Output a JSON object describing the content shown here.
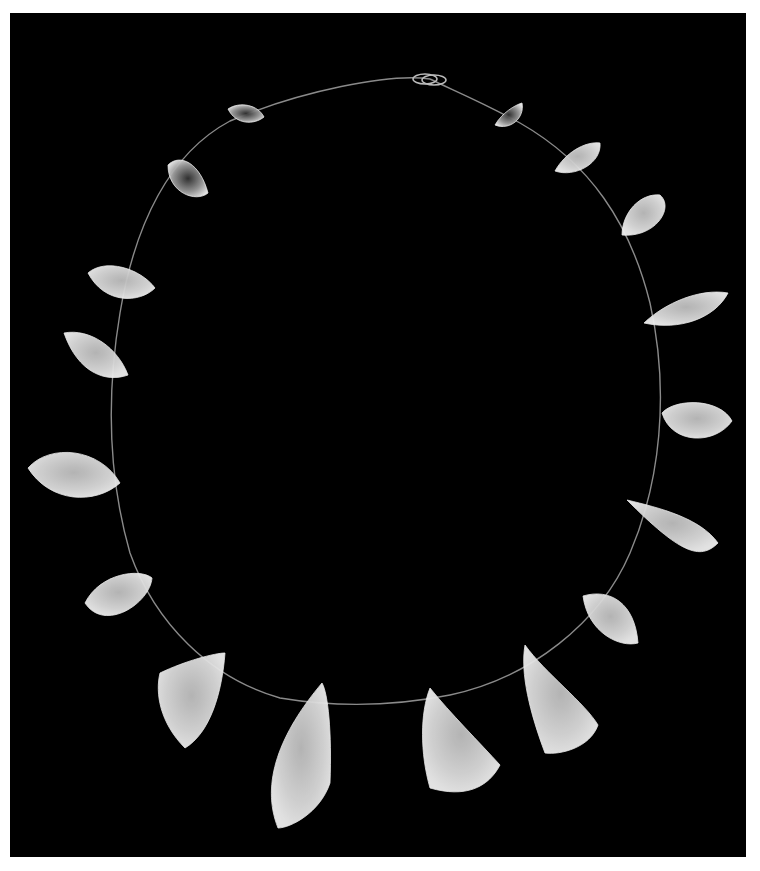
{
  "photo": {
    "subject": "rock crystal bead necklace on black background",
    "background_color": "#000000",
    "frame_color": "#ffffff",
    "bead_color": "#d8d8d8"
  },
  "necklace": {
    "cord_path": "M 420 66 C 380 60, 290 78, 220 108 C 160 140, 125 210, 110 300 C 95 390, 100 470, 120 540 C 145 610, 200 665, 270 685 C 330 695, 390 692, 440 682 C 520 665, 590 610, 620 540 C 650 470, 660 380, 640 290 C 620 210, 580 150, 510 110 C 470 88, 440 76, 420 66",
    "clasp_left": {
      "cx": 423,
      "cy": 64
    },
    "clasp_right": {
      "cx": 412,
      "cy": 75
    },
    "beads": [
      {
        "id": 1,
        "shape": "M 218 96 C 230 88, 248 92, 254 104 C 244 112, 226 112, 218 96 Z",
        "clear": true
      },
      {
        "id": 2,
        "shape": "M 158 152 C 170 140, 190 150, 198 180 C 186 190, 158 180, 158 152 Z",
        "clear": true
      },
      {
        "id": 3,
        "shape": "M 78 260 C 95 245, 130 255, 145 275 C 130 290, 95 292, 78 260 Z",
        "clear": false
      },
      {
        "id": 4,
        "shape": "M 54 320 C 80 315, 108 335, 118 362 C 96 370, 68 360, 54 320 Z",
        "clear": false
      },
      {
        "id": 5,
        "shape": "M 18 455 C 40 430, 90 435, 110 470 C 85 492, 40 490, 18 455 Z",
        "clear": false
      },
      {
        "id": 6,
        "shape": "M 75 590 C 90 560, 130 555, 142 565 C 140 590, 95 620, 75 590 Z",
        "clear": false
      },
      {
        "id": 7,
        "shape": "M 150 660 C 175 648, 205 640, 215 640 C 212 680, 200 720, 175 735 C 150 710, 145 680, 150 660 Z",
        "clear": false
      },
      {
        "id": 8,
        "shape": "M 312 670 C 318 680, 322 720, 320 770 C 310 800, 280 815, 268 815 C 250 770, 270 720, 312 670 Z",
        "clear": false
      },
      {
        "id": 9,
        "shape": "M 420 675 C 440 700, 470 730, 490 752 C 478 775, 455 785, 420 775 C 410 740, 410 700, 420 675 Z",
        "clear": false
      },
      {
        "id": 10,
        "shape": "M 515 632 C 535 660, 575 690, 588 712 C 580 735, 550 742, 535 740 C 520 700, 510 660, 515 632 Z",
        "clear": false
      },
      {
        "id": 11,
        "shape": "M 573 583 C 600 575, 625 590, 628 630 C 610 635, 578 620, 573 583 Z",
        "clear": false
      },
      {
        "id": 12,
        "shape": "M 617 487 C 650 495, 690 505, 708 530 C 690 548, 670 540, 617 487 Z",
        "clear": false
      },
      {
        "id": 13,
        "shape": "M 652 400 C 665 385, 710 385, 722 408 C 705 432, 662 432, 652 400 Z",
        "clear": false
      },
      {
        "id": 14,
        "shape": "M 634 310 C 655 290, 690 275, 718 280 C 705 305, 670 318, 634 310 Z",
        "clear": false
      },
      {
        "id": 15,
        "shape": "M 612 222 C 612 200, 630 180, 650 182 C 665 195, 645 225, 612 222 Z",
        "clear": false
      },
      {
        "id": 16,
        "shape": "M 545 158 C 555 140, 575 128, 590 130 C 592 150, 565 165, 545 158 Z",
        "clear": false
      },
      {
        "id": 17,
        "shape": "M 485 112 C 492 100, 505 92, 512 90 C 515 105, 500 118, 485 112 Z",
        "clear": true
      }
    ]
  }
}
